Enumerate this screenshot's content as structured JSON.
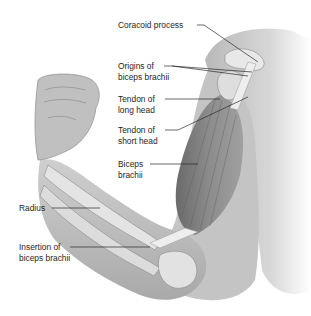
{
  "figure": {
    "colors": {
      "background": "#ffffff",
      "skin": "#c8c8c8",
      "skin_dark": "#9a9a9a",
      "muscle": "#7a7a7a",
      "bone": "#e6e6e6",
      "leader_line": "#2a2a2a",
      "text": "#1e1e1e"
    },
    "labels": [
      {
        "id": "coracoid",
        "lines": [
          "Coracoid process"
        ]
      },
      {
        "id": "origins",
        "lines": [
          "Origins of",
          "biceps brachii"
        ]
      },
      {
        "id": "tendon-long",
        "lines": [
          "Tendon of",
          "long head"
        ]
      },
      {
        "id": "tendon-short",
        "lines": [
          "Tendon of",
          "short head"
        ]
      },
      {
        "id": "biceps",
        "lines": [
          "Biceps",
          "brachii"
        ]
      },
      {
        "id": "radius",
        "lines": [
          "Radius"
        ]
      },
      {
        "id": "insertion",
        "lines": [
          "Insertion of",
          "biceps brachii"
        ]
      }
    ]
  }
}
